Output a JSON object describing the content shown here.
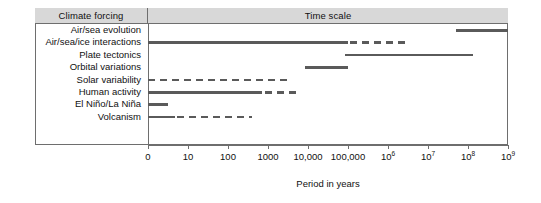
{
  "table": {
    "header": {
      "forcing_label": "Climate forcing",
      "timescale_label": "Time scale"
    }
  },
  "axis": {
    "title": "Period in years",
    "ticks": [
      {
        "label": "0",
        "exp": "",
        "pos": 0
      },
      {
        "label": "10",
        "exp": "",
        "pos": 1
      },
      {
        "label": "100",
        "exp": "",
        "pos": 2
      },
      {
        "label": "1000",
        "exp": "",
        "pos": 3
      },
      {
        "label": "10,000",
        "exp": "",
        "pos": 4
      },
      {
        "label": "100,000",
        "exp": "",
        "pos": 5
      },
      {
        "label": "10",
        "exp": "6",
        "pos": 6
      },
      {
        "label": "10",
        "exp": "7",
        "pos": 7
      },
      {
        "label": "10",
        "exp": "8",
        "pos": 8
      },
      {
        "label": "10",
        "exp": "9",
        "pos": 9
      }
    ]
  },
  "colors": {
    "bar": "#5a5a5a",
    "header_fill": "#d8d8d8",
    "border": "#6e6e6e",
    "text": "#111111"
  },
  "chart_data": {
    "type": "bar",
    "title": "Time scale",
    "xlabel": "Period in years",
    "ylabel": "Climate forcing",
    "x_scale": "log10 (decades, 0 to 10^9 years)",
    "xlim": [
      0,
      9
    ],
    "grid": false,
    "legend": "none",
    "categories": [
      "Air/sea evolution",
      "Air/sea/ice interactions",
      "Plate tectonics",
      "Orbital variations",
      "Solar variability",
      "Human activity",
      "El Niño/La Niña",
      "Volcanism"
    ],
    "bars": [
      {
        "category": "Air/sea evolution",
        "segments": [
          {
            "style": "solid",
            "start_decade": 7.7,
            "end_decade": 9.0
          }
        ]
      },
      {
        "category": "Air/sea/ice interactions",
        "segments": [
          {
            "style": "solid",
            "start_decade": 0.0,
            "end_decade": 5.0
          },
          {
            "style": "dashed",
            "start_decade": 5.05,
            "end_decade": 6.5
          }
        ]
      },
      {
        "category": "Plate tectonics",
        "segments": [
          {
            "style": "solid",
            "start_decade": 4.93,
            "end_decade": 8.13
          }
        ]
      },
      {
        "category": "Orbital variations",
        "segments": [
          {
            "style": "solid",
            "start_decade": 3.93,
            "end_decade": 5.0
          }
        ]
      },
      {
        "category": "Solar variability",
        "segments": [
          {
            "style": "dashed",
            "start_decade": 0.0,
            "end_decade": 3.5
          }
        ]
      },
      {
        "category": "Human activity",
        "segments": [
          {
            "style": "solid",
            "start_decade": 0.0,
            "end_decade": 2.85
          },
          {
            "style": "dashed",
            "start_decade": 2.93,
            "end_decade": 3.75
          }
        ]
      },
      {
        "category": "El Niño/La Niña",
        "segments": [
          {
            "style": "solid",
            "start_decade": 0.0,
            "end_decade": 0.5
          }
        ]
      },
      {
        "category": "Volcanism",
        "segments": [
          {
            "style": "solid",
            "start_decade": 0.0,
            "end_decade": 0.68
          },
          {
            "style": "dashed",
            "start_decade": 0.72,
            "end_decade": 2.6
          }
        ]
      }
    ]
  }
}
